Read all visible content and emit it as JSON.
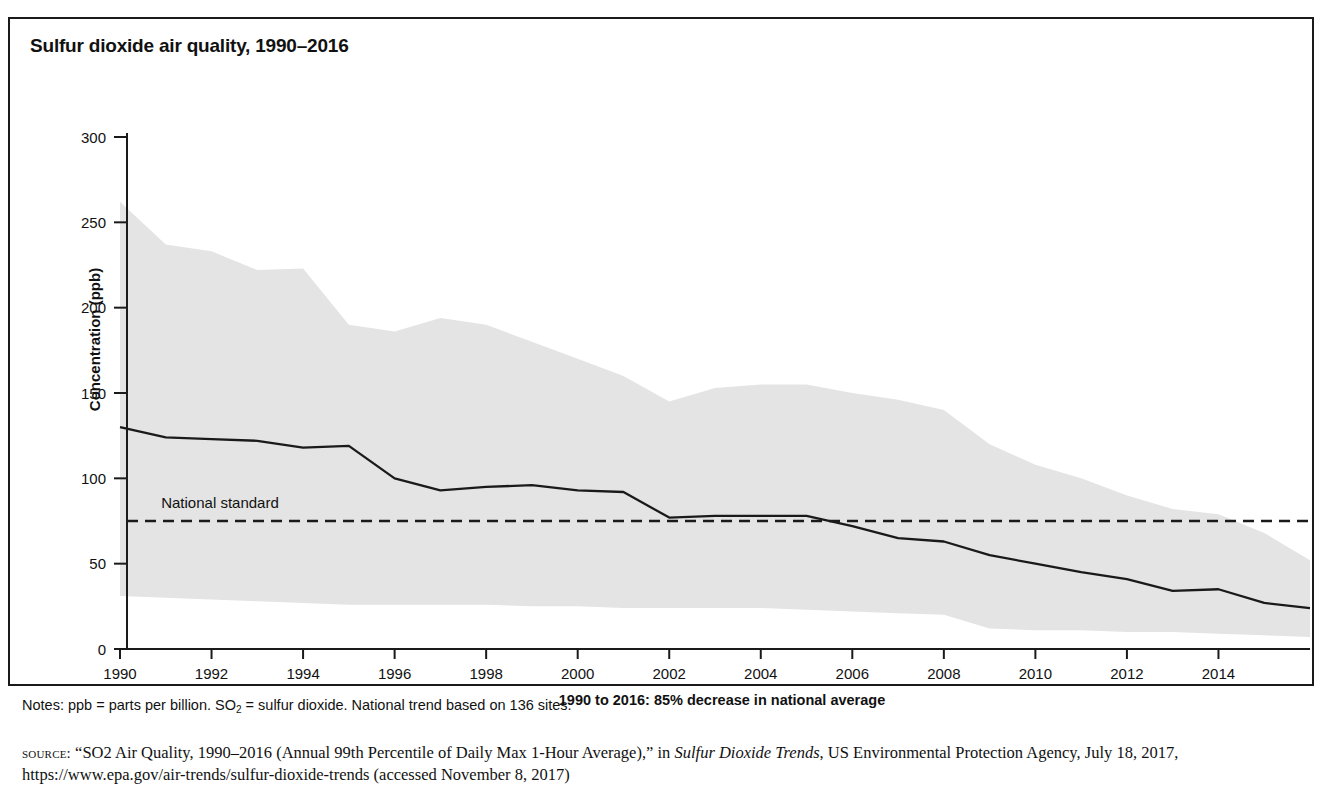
{
  "figure": {
    "title": "Sulfur dioxide air quality, 1990–2016",
    "notes_prefix": "Notes: ppb = parts per billion. SO",
    "notes_sub": "2",
    "notes_suffix": " = sulfur dioxide. National trend based on 136 sites.",
    "source_label": "source:",
    "source_part1": " “SO2 Air Quality, 1990–2016 (Annual 99th Percentile of Daily Max 1-Hour Average),” in ",
    "source_italic": "Sulfur Dioxide Trends",
    "source_part2": ", US Environmental Protection Agency, July 18, 2017, https://www.epa.gov/air-trends/sulfur-dioxide-trends (accessed November 8, 2017)"
  },
  "colors": {
    "band_fill": "#e4e4e4",
    "line": "#1a1a1a",
    "axis": "#1a1a1a",
    "frame": "#1a1a1a",
    "text": "#111111"
  },
  "chart_data": {
    "type": "area",
    "title": "Sulfur dioxide air quality, 1990–2016",
    "xlabel": "1990 to 2016: 85% decrease in national average",
    "ylabel": "Concentration (ppb)",
    "xlim": [
      1990,
      2016
    ],
    "ylim": [
      0,
      300
    ],
    "ytick_values": [
      0,
      50,
      100,
      150,
      200,
      250,
      300
    ],
    "ytick_labels": [
      "0",
      "50",
      "100",
      "150",
      "200",
      "250",
      "300"
    ],
    "xtick_values": [
      1990,
      1992,
      1994,
      1996,
      1998,
      2000,
      2002,
      2004,
      2006,
      2008,
      2010,
      2012,
      2014
    ],
    "xtick_labels": [
      "1990",
      "1992",
      "1994",
      "1996",
      "1998",
      "2000",
      "2002",
      "2004",
      "2006",
      "2008",
      "2010",
      "2012",
      "2014"
    ],
    "grid": false,
    "legend": "none",
    "x": [
      1990,
      1991,
      1992,
      1993,
      1994,
      1995,
      1996,
      1997,
      1998,
      1999,
      2000,
      2001,
      2002,
      2003,
      2004,
      2005,
      2006,
      2007,
      2008,
      2009,
      2010,
      2011,
      2012,
      2013,
      2014,
      2015,
      2016
    ],
    "series": [
      {
        "name": "90th percentile (band upper)",
        "role": "band_upper",
        "values": [
          262,
          237,
          233,
          222,
          223,
          190,
          186,
          194,
          190,
          180,
          170,
          160,
          145,
          153,
          155,
          155,
          150,
          146,
          140,
          120,
          108,
          100,
          90,
          82,
          79,
          68,
          52
        ]
      },
      {
        "name": "10th percentile (band lower)",
        "role": "band_lower",
        "values": [
          31,
          30,
          29,
          28,
          27,
          26,
          26,
          26,
          26,
          25,
          25,
          24,
          24,
          24,
          24,
          23,
          22,
          21,
          20,
          12,
          11,
          11,
          10,
          10,
          9,
          8,
          7
        ]
      },
      {
        "name": "National average",
        "role": "line",
        "values": [
          130,
          124,
          123,
          122,
          118,
          119,
          100,
          93,
          95,
          96,
          93,
          92,
          77,
          78,
          78,
          78,
          72,
          65,
          63,
          55,
          50,
          45,
          41,
          34,
          35,
          27,
          24
        ]
      }
    ],
    "annotations": [
      {
        "name": "national-standard",
        "label": "National standard",
        "type": "hline",
        "y": 75
      }
    ]
  }
}
